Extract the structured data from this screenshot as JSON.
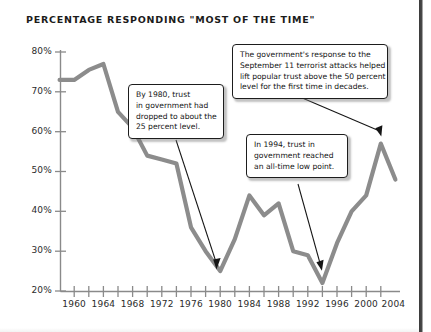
{
  "chart_data": {
    "type": "line",
    "title": "PERCENTAGE RESPONDING \"MOST OF THE TIME\"",
    "xlabel": "",
    "ylabel": "",
    "xlim": [
      1958,
      2005
    ],
    "ylim": [
      20,
      80
    ],
    "grid": false,
    "legend": "none",
    "y_ticks": [
      "20%",
      "30%",
      "40%",
      "50%",
      "60%",
      "70%",
      "80%"
    ],
    "y_tick_values": [
      20,
      30,
      40,
      50,
      60,
      70,
      80
    ],
    "x_ticks": [
      "1960",
      "1964",
      "1968",
      "1972",
      "1976",
      "1980",
      "1984",
      "1988",
      "1992",
      "1996",
      "2000",
      "2004"
    ],
    "x_tick_values": [
      1960,
      1964,
      1968,
      1972,
      1976,
      1980,
      1984,
      1988,
      1992,
      1996,
      2000,
      2004
    ],
    "x_minor_tick_values": [
      1962,
      1966,
      1970,
      1974,
      1978,
      1982,
      1986,
      1990,
      1994,
      1998,
      2002
    ],
    "series": [
      {
        "name": "Trust in government",
        "color": "#8c8c8c",
        "x": [
          1958,
          1960,
          1962,
          1964,
          1966,
          1968,
          1970,
          1972,
          1974,
          1976,
          1978,
          1980,
          1982,
          1984,
          1986,
          1988,
          1990,
          1992,
          1994,
          1996,
          1998,
          2000,
          2002,
          2004
        ],
        "values": [
          73,
          73,
          75.5,
          77,
          65,
          61,
          54,
          53,
          52,
          36,
          30,
          25,
          33,
          44,
          39,
          42,
          30,
          29,
          22,
          32,
          40,
          44,
          57,
          48
        ]
      }
    ],
    "annotations": [
      {
        "id": "callout-1980",
        "lines": [
          "By 1980, trust",
          "in government had",
          "dropped to about the",
          "25 percent level."
        ],
        "points_to": {
          "x": 1980,
          "y": 26
        }
      },
      {
        "id": "callout-sep11",
        "lines": [
          "The government's response to the",
          "September 11 terrorist attacks helped",
          "lift popular trust above the 50 percent",
          "level for the first time in decades."
        ],
        "points_to": {
          "x": 2002,
          "y": 57
        }
      },
      {
        "id": "callout-1994",
        "lines": [
          "In 1994, trust in",
          "government reached",
          "an all-time low point."
        ],
        "points_to": {
          "x": 1994,
          "y": 24
        }
      }
    ]
  },
  "colors": {
    "line": "#8c8c8c",
    "axis": "#8a8a8a",
    "text": "#1b1b1b",
    "callout_border": "#1d1d1d",
    "arrow": "#151515",
    "background": "#ffffff"
  }
}
